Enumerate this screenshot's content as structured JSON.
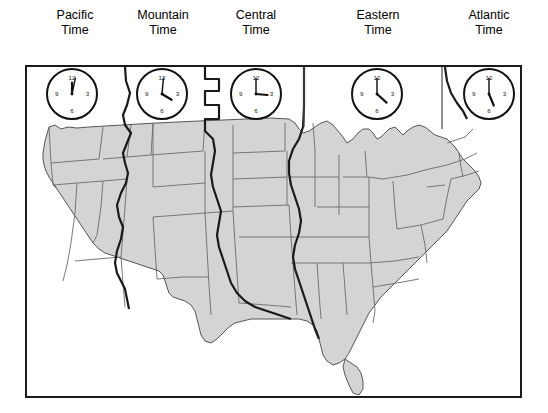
{
  "figure": {
    "map_fill_color": "#d4d4d4",
    "map_border_color": "#6b6b6b",
    "frame_color": "#1a1a1a",
    "zone_divider_color": "#1a1a1a",
    "background_color": "#ffffff"
  },
  "zones": [
    {
      "id": "pacific",
      "label_line1": "Pacific",
      "label_line2": "Time",
      "label_center_x": 75,
      "clock": {
        "hour": 12,
        "minute": 2,
        "display": "12:02",
        "cx": 72,
        "cy": 94,
        "r": 26
      }
    },
    {
      "id": "mountain",
      "label_line1": "Mountain",
      "label_line2": "Time",
      "label_center_x": 163,
      "clock": {
        "hour": 1,
        "minute": 2,
        "display": "1:02",
        "cx": 162,
        "cy": 94,
        "r": 26
      }
    },
    {
      "id": "central",
      "label_line1": "Central",
      "label_line2": "Time",
      "label_center_x": 256,
      "clock": {
        "hour": 2,
        "minute": 1,
        "display": "2:01",
        "cx": 256,
        "cy": 94,
        "r": 26
      }
    },
    {
      "id": "eastern",
      "label_line1": "Eastern",
      "label_line2": "Time",
      "label_center_x": 378,
      "clock": {
        "hour": 3,
        "minute": 1,
        "display": "3:01",
        "cx": 377,
        "cy": 94,
        "r": 26
      }
    },
    {
      "id": "atlantic",
      "label_line1": "Atlantic",
      "label_line2": "Time",
      "label_center_x": 489,
      "clock": {
        "hour": 4,
        "minute": 1,
        "display": "4:01",
        "cx": 489,
        "cy": 94,
        "r": 26
      }
    }
  ],
  "clock_numerals": [
    "12",
    "3",
    "6",
    "9"
  ],
  "dividers": [
    {
      "id": "pacific-mountain",
      "type": "wavy"
    },
    {
      "id": "mountain-central",
      "type": "stepped"
    },
    {
      "id": "central-eastern",
      "type": "straight",
      "x": 302
    },
    {
      "id": "eastern-atlantic",
      "type": "straight",
      "x": 440
    }
  ]
}
